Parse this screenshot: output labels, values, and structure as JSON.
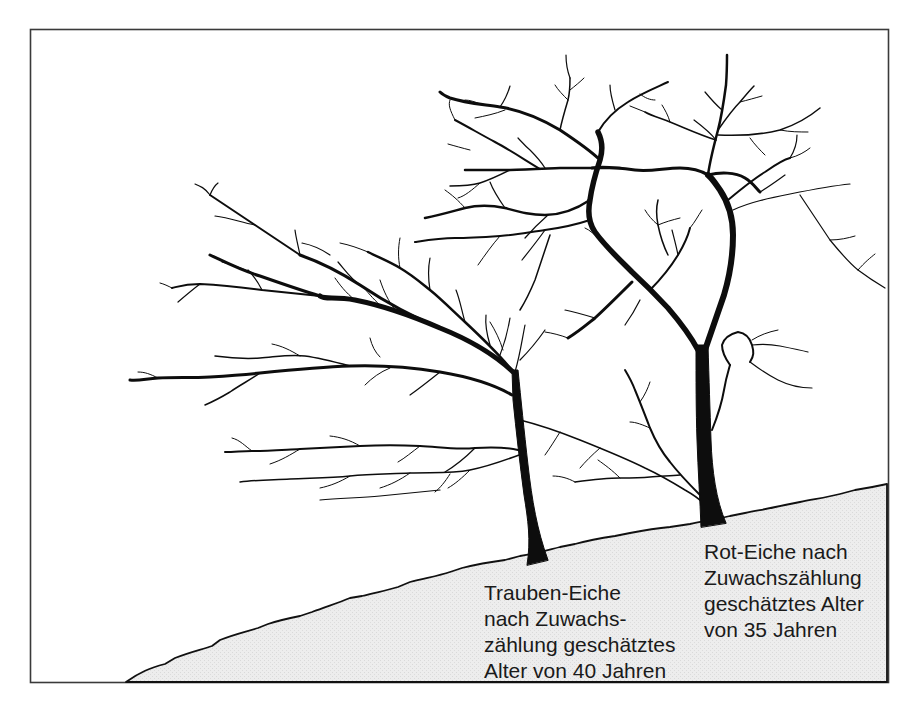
{
  "figure": {
    "type": "illustration",
    "colors": {
      "frame": "#333333",
      "ink": "#0d0d0d",
      "ground_fill": "#ebebeb",
      "background": "#ffffff"
    }
  },
  "labels": {
    "trauben_eiche": {
      "lines": [
        "Trauben-Eiche",
        "nach Zuwachs-",
        "zählung geschätztes",
        "Alter von 40 Jahren"
      ]
    },
    "rot_eiche": {
      "lines": [
        "Rot-Eiche nach",
        "Zuwachszählung",
        "geschätztes Alter",
        "von 35 Jahren"
      ]
    }
  }
}
